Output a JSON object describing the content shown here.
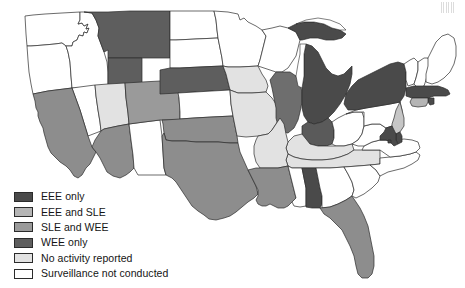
{
  "figure": {
    "type": "choropleth-map",
    "region": "United States"
  },
  "colors": {
    "eee_only": "#4a4a4a",
    "eee_and_sle": "#b5b5b5",
    "sle_and_wee": "#9a9a9a",
    "wee_only": "#5e5e5e",
    "no_activity": "#e2e2e2",
    "not_conducted": "#ffffff",
    "border": "#2b2b2b",
    "background": "#ffffff"
  },
  "legend": {
    "items": [
      {
        "label": "EEE only",
        "key": "eee_only",
        "color": "#4a4a4a"
      },
      {
        "label": "EEE and SLE",
        "key": "eee_and_sle",
        "color": "#b5b5b5"
      },
      {
        "label": "SLE and WEE",
        "key": "sle_and_wee",
        "color": "#9a9a9a"
      },
      {
        "label": "WEE only",
        "key": "wee_only",
        "color": "#5e5e5e"
      },
      {
        "label": "No activity reported",
        "key": "no_activity",
        "color": "#e2e2e2"
      },
      {
        "label": "Surveillance not conducted",
        "key": "not_conducted",
        "color": "#ffffff"
      }
    ]
  },
  "states": {
    "WA": {
      "name": "Washington",
      "category": "not_conducted",
      "color": "#ffffff"
    },
    "OR": {
      "name": "Oregon",
      "category": "not_conducted",
      "color": "#ffffff"
    },
    "ID": {
      "name": "Idaho",
      "category": "not_conducted",
      "color": "#ffffff"
    },
    "MT": {
      "name": "Montana",
      "category": "wee_only",
      "color": "#5e5e5e"
    },
    "ND": {
      "name": "North Dakota",
      "category": "not_conducted",
      "color": "#ffffff"
    },
    "SD": {
      "name": "South Dakota",
      "category": "not_conducted",
      "color": "#ffffff"
    },
    "MN": {
      "name": "Minnesota",
      "category": "not_conducted",
      "color": "#ffffff"
    },
    "WI": {
      "name": "Wisconsin",
      "category": "not_conducted",
      "color": "#ffffff"
    },
    "MI": {
      "name": "Michigan",
      "category": "eee_only",
      "color": "#4a4a4a"
    },
    "CA": {
      "name": "California",
      "category": "sle_and_wee",
      "color": "#8d8d8d"
    },
    "NV": {
      "name": "Nevada",
      "category": "not_conducted",
      "color": "#ffffff"
    },
    "UT": {
      "name": "Utah",
      "category": "no_activity",
      "color": "#e2e2e2"
    },
    "WY": {
      "name": "Wyoming",
      "category": "wee_only",
      "color": "#5e5e5e"
    },
    "CO": {
      "name": "Colorado",
      "category": "sle_and_wee",
      "color": "#9a9a9a"
    },
    "AZ": {
      "name": "Arizona",
      "category": "sle_and_wee",
      "color": "#8d8d8d"
    },
    "NM": {
      "name": "New Mexico",
      "category": "not_conducted",
      "color": "#ffffff"
    },
    "NE": {
      "name": "Nebraska",
      "category": "wee_only",
      "color": "#5e5e5e"
    },
    "KS": {
      "name": "Kansas",
      "category": "not_conducted",
      "color": "#ffffff"
    },
    "OK": {
      "name": "Oklahoma",
      "category": "sle_and_wee",
      "color": "#8d8d8d"
    },
    "TX": {
      "name": "Texas",
      "category": "sle_and_wee",
      "color": "#8d8d8d"
    },
    "IA": {
      "name": "Iowa",
      "category": "no_activity",
      "color": "#e2e2e2"
    },
    "MO": {
      "name": "Missouri",
      "category": "no_activity",
      "color": "#e2e2e2"
    },
    "AR": {
      "name": "Arkansas",
      "category": "no_activity",
      "color": "#e2e2e2"
    },
    "LA": {
      "name": "Louisiana",
      "category": "sle_and_wee",
      "color": "#8d8d8d"
    },
    "IL": {
      "name": "Illinois",
      "category": "eee_only",
      "color": "#6e6e6e"
    },
    "IN": {
      "name": "Indiana",
      "category": "eee_only",
      "color": "#5a5a5a"
    },
    "OH": {
      "name": "Ohio",
      "category": "not_conducted",
      "color": "#ffffff"
    },
    "KY": {
      "name": "Kentucky",
      "category": "no_activity",
      "color": "#e2e2e2"
    },
    "TN": {
      "name": "Tennessee",
      "category": "no_activity",
      "color": "#e2e2e2"
    },
    "MS": {
      "name": "Mississippi",
      "category": "not_conducted",
      "color": "#ffffff"
    },
    "AL": {
      "name": "Alabama",
      "category": "eee_only",
      "color": "#4a4a4a"
    },
    "GA": {
      "name": "Georgia",
      "category": "not_conducted",
      "color": "#ffffff"
    },
    "FL": {
      "name": "Florida",
      "category": "sle_and_wee",
      "color": "#8d8d8d"
    },
    "SC": {
      "name": "South Carolina",
      "category": "not_conducted",
      "color": "#ffffff"
    },
    "NC": {
      "name": "North Carolina",
      "category": "not_conducted",
      "color": "#ffffff"
    },
    "VA": {
      "name": "Virginia",
      "category": "not_conducted",
      "color": "#ffffff"
    },
    "WV": {
      "name": "West Virginia",
      "category": "not_conducted",
      "color": "#ffffff"
    },
    "PA": {
      "name": "Pennsylvania",
      "category": "not_conducted",
      "color": "#ffffff"
    },
    "NY": {
      "name": "New York",
      "category": "eee_only",
      "color": "#4a4a4a"
    },
    "VT": {
      "name": "Vermont",
      "category": "not_conducted",
      "color": "#ffffff"
    },
    "NH": {
      "name": "New Hampshire",
      "category": "not_conducted",
      "color": "#ffffff"
    },
    "ME": {
      "name": "Maine",
      "category": "not_conducted",
      "color": "#ffffff"
    },
    "MA": {
      "name": "Massachusetts",
      "category": "eee_only",
      "color": "#4a4a4a"
    },
    "RI": {
      "name": "Rhode Island",
      "category": "eee_only",
      "color": "#4a4a4a"
    },
    "CT": {
      "name": "Connecticut",
      "category": "eee_and_sle",
      "color": "#b5b5b5"
    },
    "NJ": {
      "name": "New Jersey",
      "category": "eee_and_sle",
      "color": "#c6c6c6"
    },
    "DE": {
      "name": "Delaware",
      "category": "eee_only",
      "color": "#4a4a4a"
    },
    "MD": {
      "name": "Maryland",
      "category": "eee_only",
      "color": "#4a4a4a"
    },
    "DC": {
      "name": "District of Columbia",
      "category": "eee_only",
      "color": "#4a4a4a"
    }
  }
}
